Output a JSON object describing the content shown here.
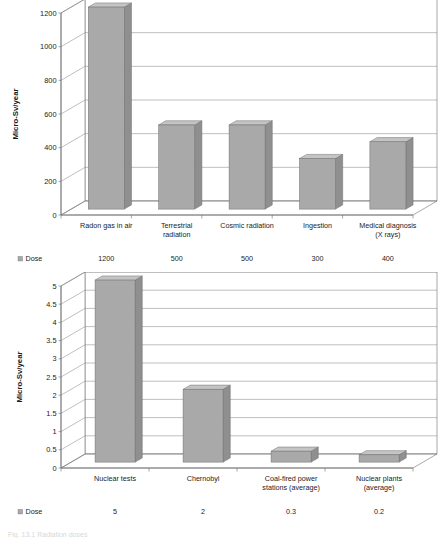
{
  "figure": {
    "caption": "Fig. 13.1  Radiation doses"
  },
  "chart_data": [
    {
      "type": "bar",
      "id": "natural-and-medical-dose",
      "title": "",
      "xlabel": "",
      "ylabel": "Micro-Sv/year",
      "ylim": [
        0,
        1200
      ],
      "yticks": [
        "0",
        "200",
        "400",
        "600",
        "800",
        "1000",
        "1200"
      ],
      "grid": true,
      "legend_position": "bottom-left",
      "legend": [
        "Dose"
      ],
      "categories": [
        "Radon gas in air",
        "Terrestrial radiation",
        "Cosmic radiation",
        "Ingestion",
        "Medical diagnosis (X rays)"
      ],
      "category_lines": [
        [
          "Radon gas in air"
        ],
        [
          "Terrestrial",
          "radiation"
        ],
        [
          "Cosmic radiation"
        ],
        [
          "Ingestion"
        ],
        [
          "Medical diagnosis",
          "(X rays)"
        ]
      ],
      "series": [
        {
          "name": "Dose",
          "values": [
            1200,
            500,
            500,
            300,
            400
          ],
          "value_labels": [
            "1200",
            "500",
            "500",
            "300",
            "400"
          ]
        }
      ]
    },
    {
      "type": "bar",
      "id": "artificial-dose",
      "title": "",
      "xlabel": "",
      "ylabel": "Micro-Sv/year",
      "ylim": [
        0,
        5
      ],
      "yticks": [
        "0",
        "0.5",
        "1",
        "1.5",
        "2",
        "2.5",
        "3",
        "3.5",
        "4",
        "4.5",
        "5"
      ],
      "grid": true,
      "legend_position": "bottom-left",
      "legend": [
        "Dose"
      ],
      "categories": [
        "Nuclear tests",
        "Chernobyl",
        "Coal-fired power stations (average)",
        "Nuclear plants (average)"
      ],
      "category_lines": [
        [
          "Nuclear tests"
        ],
        [
          "Chernobyl"
        ],
        [
          "Coal-fired power",
          "stations (average)"
        ],
        [
          "Nuclear plants",
          "(average)"
        ]
      ],
      "series": [
        {
          "name": "Dose",
          "values": [
            5,
            2,
            0.3,
            0.2
          ],
          "value_labels": [
            "5",
            "2",
            "0.3",
            "0.2"
          ]
        }
      ]
    }
  ],
  "colors": {
    "bar_front": "#a9a9a9",
    "bar_top": "#c4c4c4",
    "bar_side": "#8f8f8f",
    "grid": "#8a8a8a",
    "axis": "#6e6e6e",
    "wall": "#ffffff",
    "floor": "#ffffff",
    "text": "#1c1c1c"
  }
}
